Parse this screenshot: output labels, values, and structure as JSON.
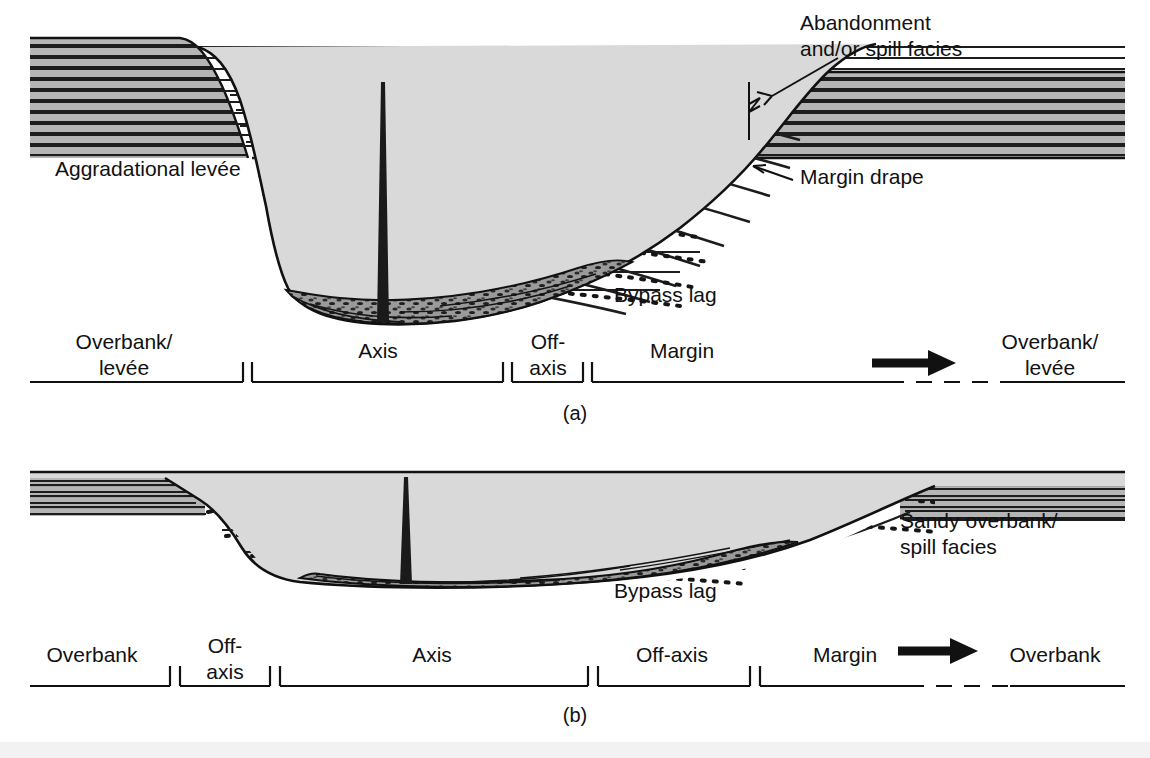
{
  "figure": {
    "background_color": "#ffffff",
    "levee_fill": "#b5b5b5",
    "channel_fill": "#d9d9d9",
    "lag_fill": "#8f8f8f",
    "line_color": "#111111"
  },
  "panels": [
    {
      "id": "a",
      "caption": "(a)",
      "annotations": [
        {
          "name": "aggradational-levee",
          "text": "Aggradational levée",
          "x": 55,
          "y": 176
        },
        {
          "name": "abandonment-spill-facies",
          "line1": "Abandonment",
          "line2": "and/or spill facies",
          "x": 800,
          "y": 30
        },
        {
          "name": "margin-drape",
          "text": "Margin drape",
          "x": 800,
          "y": 184
        },
        {
          "name": "bypass-lag",
          "text": "Bypass lag",
          "x": 614,
          "y": 302
        }
      ],
      "zones": [
        {
          "name": "overbank-levee-left",
          "line1": "Overbank/",
          "line2": "levée",
          "label_x": 124,
          "start": 30,
          "end": 243
        },
        {
          "name": "axis",
          "line1": "Axis",
          "line2": "",
          "label_x": 378,
          "start": 252,
          "end": 503
        },
        {
          "name": "off-axis",
          "line1": "Off-",
          "line2": "axis",
          "label_x": 548,
          "start": 512,
          "end": 583
        },
        {
          "name": "margin",
          "line1": "Margin",
          "line2": "",
          "label_x": 682,
          "start": 592,
          "end": 1125
        },
        {
          "name": "overbank-levee-right",
          "line1": "Overbank/",
          "line2": "levée",
          "label_x": 1050,
          "start": 0,
          "end": 0
        }
      ],
      "flow_arrow": {
        "name": "flow-direction-arrow",
        "x": 905,
        "y": 363
      }
    },
    {
      "id": "b",
      "caption": "(b)",
      "annotations": [
        {
          "name": "sandy-overbank-spill-facies",
          "line1": "Sandy overbank/",
          "line2": "spill facies",
          "x": 900,
          "y": 528
        },
        {
          "name": "bypass-lag",
          "text": "Bypass lag",
          "x": 614,
          "y": 590
        }
      ],
      "zones": [
        {
          "name": "overbank-left",
          "line1": "Overbank",
          "line2": "",
          "label_x": 92,
          "start": 30,
          "end": 170
        },
        {
          "name": "off-axis-left",
          "line1": "Off-",
          "line2": "axis",
          "label_x": 225,
          "start": 180,
          "end": 270
        },
        {
          "name": "axis",
          "line1": "Axis",
          "line2": "",
          "label_x": 432,
          "start": 280,
          "end": 588
        },
        {
          "name": "off-axis-right",
          "line1": "Off-axis",
          "line2": "",
          "label_x": 672,
          "start": 598,
          "end": 750
        },
        {
          "name": "margin",
          "line1": "Margin",
          "line2": "",
          "label_x": 845,
          "start": 760,
          "end": 1125
        },
        {
          "name": "overbank-right",
          "line1": "Overbank",
          "line2": "",
          "label_x": 1050,
          "start": 0,
          "end": 0
        }
      ],
      "flow_arrow": {
        "name": "flow-direction-arrow",
        "x": 925,
        "y": 651
      }
    }
  ]
}
